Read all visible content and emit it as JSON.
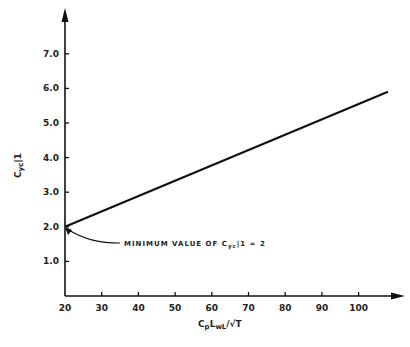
{
  "chart_data": {
    "type": "line",
    "title": "",
    "xlabel": "CpLwL/√T",
    "ylabel": "Cyc|1",
    "xlim": [
      20,
      110
    ],
    "ylim": [
      0,
      7.5
    ],
    "x_ticks": [
      20,
      30,
      40,
      50,
      60,
      70,
      80,
      90,
      100
    ],
    "x_tick_labels": [
      "20",
      "30",
      "40",
      "50",
      "60",
      "70",
      "80",
      "90",
      "100"
    ],
    "y_ticks": [
      1.0,
      2.0,
      3.0,
      4.0,
      5.0,
      6.0,
      7.0
    ],
    "y_tick_labels": [
      "1.0",
      "2.0",
      "3.0",
      "4.0",
      "5.0",
      "6.0",
      "7.0"
    ],
    "grid": false,
    "legend": null,
    "series": [
      {
        "name": "Cyc|1",
        "x": [
          20,
          108
        ],
        "y": [
          2.0,
          5.9
        ]
      }
    ],
    "annotations": [
      {
        "text": "MINIMUM VALUE OF Cyc|1 = 2",
        "points_to": {
          "x": 20,
          "y": 2.0
        }
      }
    ]
  },
  "labels": {
    "annotation": "MINIMUM VALUE OF C",
    "annotation_sub": "yc",
    "annotation_tail": "|1 = 2",
    "xlabel_main": "C",
    "xlabel_sub1": "p",
    "xlabel_mid": "L",
    "xlabel_sub2": "wL",
    "xlabel_tail": "/√T",
    "ylabel_main": "C",
    "ylabel_sub": "yc",
    "ylabel_tail": "|1"
  }
}
